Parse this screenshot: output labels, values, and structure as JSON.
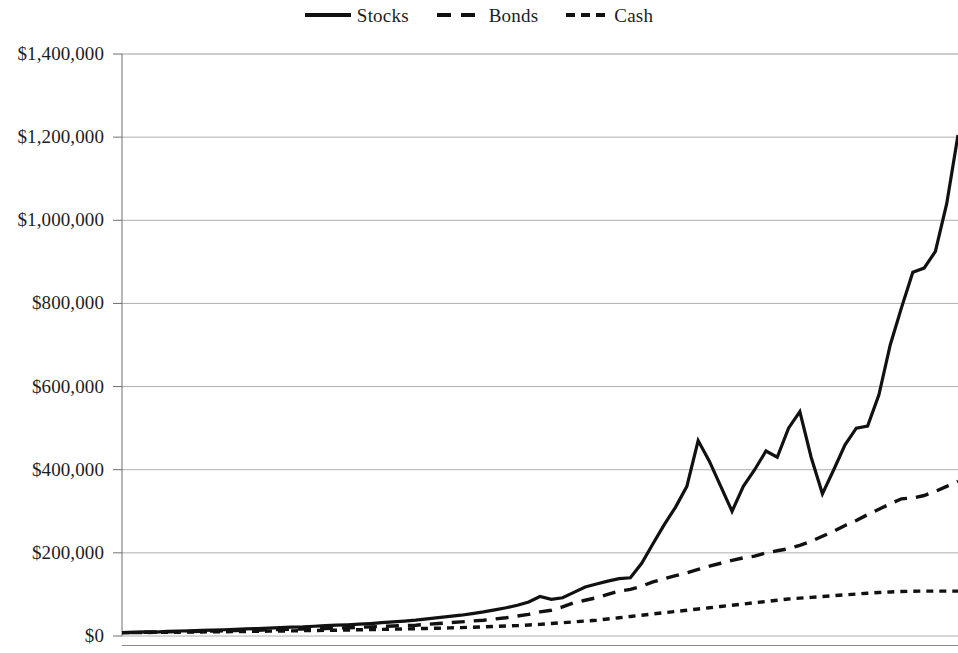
{
  "legend": {
    "position": "top-center",
    "items": [
      {
        "label": "Stocks",
        "style": "solid",
        "icon": "line-solid-icon"
      },
      {
        "label": "Bonds",
        "style": "dashed",
        "icon": "line-dashed-icon"
      },
      {
        "label": "Cash",
        "style": "dotted",
        "icon": "line-dotted-icon"
      }
    ]
  },
  "axis": {
    "y_ticks": [
      "$0",
      "$200,000",
      "$400,000",
      "$600,000",
      "$800,000",
      "$1,000,000",
      "$1,200,000",
      "$1,400,000"
    ],
    "y_tick_values": [
      0,
      200000,
      400000,
      600000,
      800000,
      1000000,
      1200000,
      1400000
    ],
    "x_ticks": []
  },
  "chart_data": {
    "type": "line",
    "title": "",
    "subtitle": "",
    "xlabel": "",
    "ylabel": "",
    "ylim": [
      0,
      1400000
    ],
    "xlim": [
      0,
      74
    ],
    "grid": "horizontal",
    "legend_position": "top-center",
    "y_tick_labels": [
      "$0",
      "$200,000",
      "$400,000",
      "$600,000",
      "$800,000",
      "$1,000,000",
      "$1,200,000",
      "$1,400,000"
    ],
    "x_tick_labels": [],
    "x": [
      0,
      1,
      2,
      3,
      4,
      5,
      6,
      7,
      8,
      9,
      10,
      11,
      12,
      13,
      14,
      15,
      16,
      17,
      18,
      19,
      20,
      21,
      22,
      23,
      24,
      25,
      26,
      27,
      28,
      29,
      30,
      31,
      32,
      33,
      34,
      35,
      36,
      37,
      38,
      39,
      40,
      41,
      42,
      43,
      44,
      45,
      46,
      47,
      48,
      49,
      50,
      51,
      52,
      53,
      54,
      55,
      56,
      57,
      58,
      59,
      60,
      61,
      62,
      63,
      64,
      65,
      66,
      67,
      68,
      69,
      70,
      71,
      72,
      73,
      74
    ],
    "series": [
      {
        "name": "Stocks",
        "style": "solid",
        "color": "#111111",
        "final_value": 1205000,
        "values": [
          8000,
          9000,
          10000,
          9500,
          11000,
          12000,
          12500,
          13500,
          14000,
          15000,
          16000,
          17000,
          18000,
          19000,
          20000,
          21500,
          22000,
          23500,
          25000,
          26000,
          27000,
          28500,
          30000,
          32000,
          34000,
          36000,
          38000,
          41000,
          44000,
          47000,
          50000,
          54000,
          58000,
          63000,
          68000,
          74000,
          82000,
          95000,
          88000,
          92000,
          105000,
          118000,
          125000,
          132000,
          138000,
          140000,
          175000,
          222000,
          268000,
          310000,
          360000,
          470000,
          420000,
          360000,
          300000,
          360000,
          400000,
          445000,
          430000,
          500000,
          540000,
          430000,
          342000,
          400000,
          460000,
          500000,
          505000,
          580000,
          700000,
          790000,
          875000,
          885000,
          925000,
          1040000,
          1205000
        ]
      },
      {
        "name": "Bonds",
        "style": "dashed",
        "color": "#111111",
        "final_value": 372000,
        "values": [
          8000,
          8500,
          9000,
          9500,
          10000,
          10500,
          11000,
          11500,
          12000,
          12500,
          13000,
          13500,
          14000,
          15000,
          15500,
          16000,
          17000,
          17500,
          18000,
          19000,
          20000,
          21000,
          22000,
          23000,
          24000,
          25000,
          26000,
          28000,
          30000,
          32000,
          34000,
          36000,
          38000,
          41000,
          44000,
          48000,
          52000,
          58000,
          62000,
          70000,
          80000,
          86000,
          92000,
          100000,
          108000,
          112000,
          120000,
          130000,
          138000,
          145000,
          152000,
          160000,
          168000,
          175000,
          182000,
          188000,
          192000,
          200000,
          205000,
          210000,
          218000,
          228000,
          240000,
          252000,
          266000,
          278000,
          292000,
          305000,
          318000,
          330000,
          332000,
          338000,
          348000,
          360000,
          372000
        ]
      },
      {
        "name": "Cash",
        "style": "dotted",
        "color": "#111111",
        "final_value": 108000,
        "values": [
          8000,
          8200,
          8500,
          8700,
          9000,
          9200,
          9500,
          9800,
          10000,
          10300,
          10600,
          11000,
          11300,
          11700,
          12000,
          12400,
          12800,
          13200,
          13600,
          14000,
          14500,
          15000,
          15500,
          16000,
          16500,
          17000,
          17600,
          18200,
          18800,
          19500,
          20200,
          21000,
          22000,
          23000,
          24000,
          25000,
          26500,
          28000,
          30000,
          32000,
          34000,
          36000,
          38000,
          41000,
          44000,
          47000,
          50000,
          53000,
          56000,
          59000,
          62000,
          65000,
          68000,
          71000,
          74000,
          77000,
          80000,
          83000,
          86000,
          89000,
          91000,
          93000,
          95000,
          97000,
          99000,
          101000,
          103000,
          104500,
          106000,
          107000,
          107500,
          108000,
          108000,
          108000,
          108000
        ]
      }
    ]
  },
  "colors": {
    "line": "#111111",
    "grid": "#9b9b9b",
    "axis": "#6e6e6e",
    "text": "#1d1d1d",
    "background": "#ffffff"
  }
}
